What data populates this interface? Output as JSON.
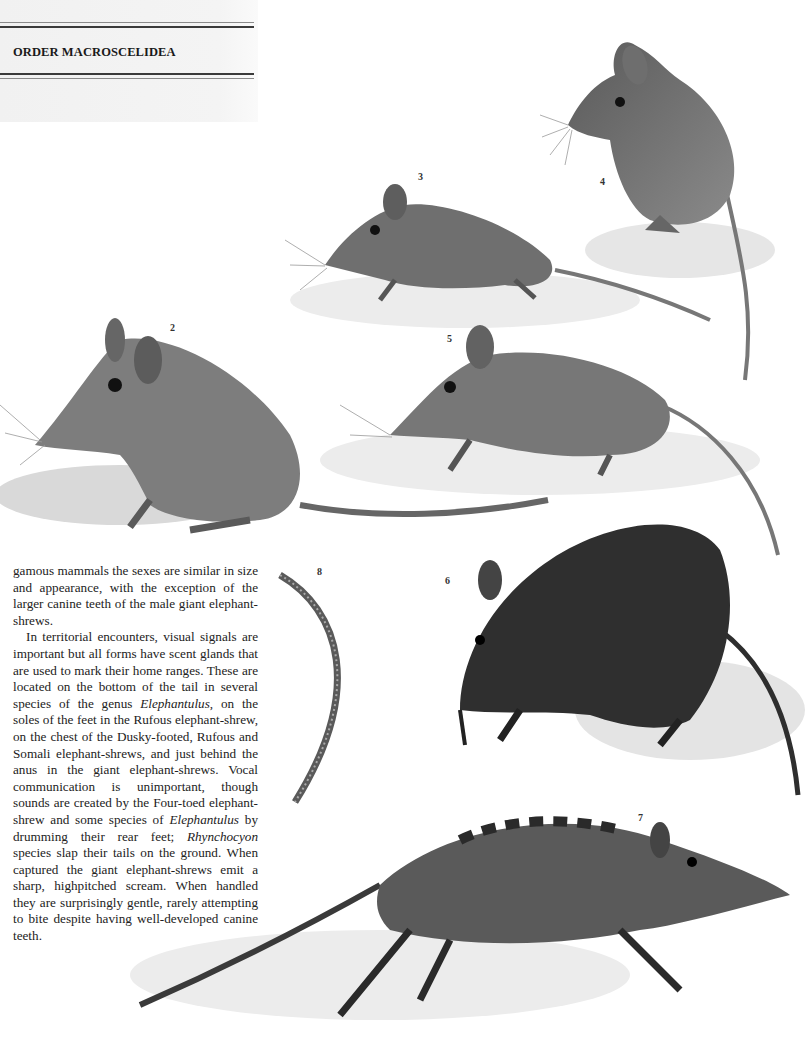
{
  "header": {
    "section_title": "ORDER MACROSCELIDEA"
  },
  "body_text": {
    "paragraphs": [
      {
        "indent": false,
        "segments": [
          {
            "text": "gamous mammals the sexes are similar in size and appearance, with the exception of the larger canine teeth of the male giant elephant-shrews.",
            "italic": false
          }
        ]
      },
      {
        "indent": true,
        "segments": [
          {
            "text": "In territorial encounters, visual signals are important but all forms have scent glands that are used to mark their home ranges. These are located on the bottom of the tail in several species of the genus ",
            "italic": false
          },
          {
            "text": "Elephantulus",
            "italic": true
          },
          {
            "text": ", on the soles of the feet in the Rufous elephant-shrew, on the chest of the Dusky-footed, Rufous and Somali elephant-shrews, and just behind the anus in the giant elephant-shrews. Vocal communi­cation is unimportant, though sounds are created by the Four-toed elephant-shrew and some species of ",
            "italic": false
          },
          {
            "text": "Elephantulus",
            "italic": true
          },
          {
            "text": " by drum­ming their rear feet; ",
            "italic": false
          },
          {
            "text": "Rhynchocyon",
            "italic": true
          },
          {
            "text": " species slap their tails on the ground. When captured the giant elephant-shrews emit a sharp, highpitched scream. When handled they are surprisingly gentle, rarely attempting to bite despite having well-developed canine teeth.",
            "italic": false
          }
        ]
      }
    ]
  },
  "figures": [
    {
      "number": "2",
      "subject": "elephant-shrew sitting among grass"
    },
    {
      "number": "3",
      "subject": "elephant-shrew on sandy mound"
    },
    {
      "number": "4",
      "subject": "elephant-shrew standing, grooming"
    },
    {
      "number": "5",
      "subject": "elephant-shrew sniffing ground"
    },
    {
      "number": "6",
      "subject": "dark elephant-shrew foraging"
    },
    {
      "number": "7",
      "subject": "giant elephant-shrew walking"
    },
    {
      "number": "8",
      "subject": "tail detail"
    }
  ],
  "colors": {
    "page": "#ffffff",
    "header_panel": "#f2f2f2",
    "rule": "#3a3a3a",
    "ink": "#1c1c1c"
  }
}
